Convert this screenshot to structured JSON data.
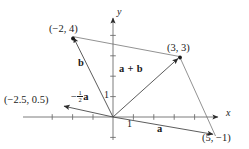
{
  "figure": {
    "type": "vector-diagram",
    "width": 249,
    "height": 149,
    "background": "#ffffff",
    "stroke_color": "#3a3a3a",
    "text_color": "#1a1a1a"
  },
  "axes": {
    "x_label": "x",
    "y_label": "y",
    "x_tick_label": "1",
    "y_tick_label": "1",
    "origin_px": [
      113,
      117
    ],
    "unit_px": 20.4,
    "x_range": [
      -4.4,
      5.8
    ],
    "y_range": [
      -1.6,
      5.4
    ],
    "grid": false,
    "tick_marks": true
  },
  "points": [
    {
      "name": "point-b-tip",
      "label": "(−2, 4)",
      "coords": [
        -2,
        4
      ],
      "px": [
        73,
        39
      ]
    },
    {
      "name": "point-sum-tip",
      "label": "(3, 3)",
      "coords": [
        3,
        3
      ],
      "px": [
        180,
        58
      ]
    },
    {
      "name": "point-a-tip",
      "label": "(5, −1)",
      "coords": [
        5,
        -1
      ],
      "px": [
        215,
        134
      ]
    },
    {
      "name": "point-half-a-tip",
      "label": "(−2.5, 0.5)",
      "coords": [
        -2.5,
        0.5
      ],
      "px": [
        62,
        104
      ]
    }
  ],
  "vectors": [
    {
      "name": "vector-a",
      "label": "a",
      "from": [
        0,
        0
      ],
      "to": [
        5,
        -1
      ],
      "label_px": [
        160,
        129
      ]
    },
    {
      "name": "vector-b",
      "label": "b",
      "from": [
        0,
        0
      ],
      "to": [
        -2,
        4
      ],
      "label_px": [
        82,
        63
      ]
    },
    {
      "name": "vector-a-plus-b",
      "label": "a + b",
      "from": [
        0,
        0
      ],
      "to": [
        3,
        3
      ],
      "label_px": [
        127,
        69
      ]
    },
    {
      "name": "vector-neg-half-a",
      "label_minus": "−",
      "label_num": "1",
      "label_den": "2",
      "label_vec": "a",
      "from": [
        0,
        0
      ],
      "to": [
        -2.5,
        0.5
      ],
      "label_px": [
        80,
        95
      ]
    }
  ],
  "construction_lines": [
    {
      "name": "line-b-tip-to-sum-tip",
      "from": [
        -2,
        4
      ],
      "to": [
        3,
        3
      ]
    },
    {
      "name": "line-sum-tip-to-a-tip",
      "from": [
        3,
        3
      ],
      "to": [
        5,
        -1
      ]
    }
  ]
}
